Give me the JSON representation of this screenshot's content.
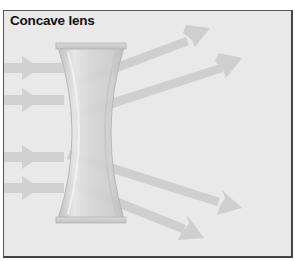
{
  "diagram": {
    "title": "Concave lens",
    "incoming_rays": 4,
    "outgoing_rays": 4,
    "colors": {
      "background": "#e9e9e9",
      "border": "#555555",
      "ray": "#c9c9c9",
      "lens_fill": "#d2d2d2",
      "lens_edge": "#b8b8b8"
    }
  }
}
